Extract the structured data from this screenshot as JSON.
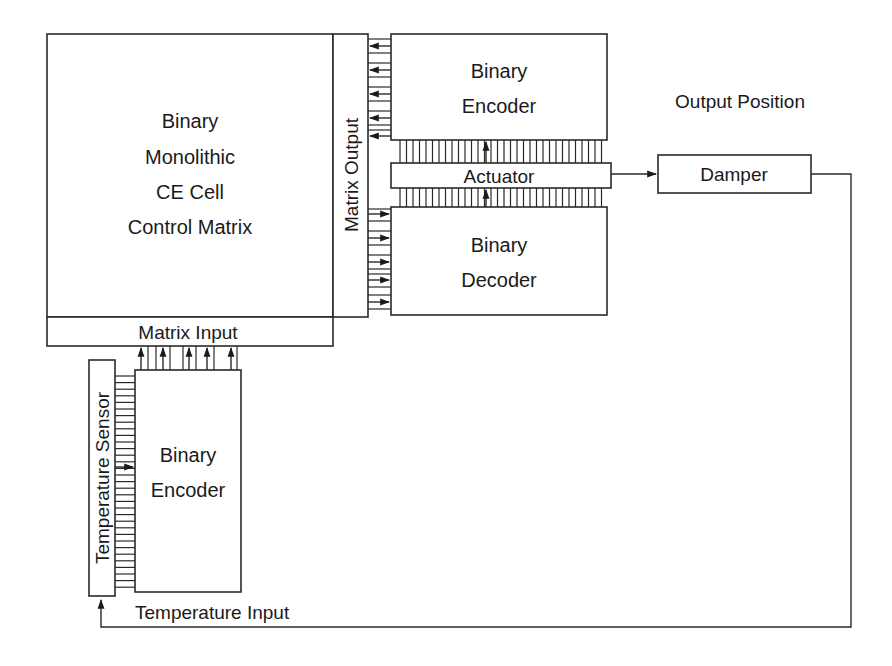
{
  "diagram": {
    "type": "block-diagram",
    "blocks": {
      "control_matrix": {
        "lines": [
          "Binary",
          "Monolithic",
          "CE Cell",
          "Control Matrix"
        ]
      },
      "matrix_input": {
        "label": "Matrix Input"
      },
      "matrix_output": {
        "label": "Matrix Output"
      },
      "output_encoder": {
        "lines": [
          "Binary",
          "Encoder"
        ]
      },
      "actuator": {
        "label": "Actuator"
      },
      "output_decoder": {
        "lines": [
          "Binary",
          "Decoder"
        ]
      },
      "damper": {
        "label": "Damper"
      },
      "temperature_sensor": {
        "label": "Temperature Sensor"
      },
      "input_encoder": {
        "lines": [
          "Binary",
          "Encoder"
        ]
      }
    },
    "labels": {
      "output_position": "Output Position",
      "temperature_input": "Temperature Input"
    },
    "connections": [
      {
        "from": "Binary Encoder (output)",
        "to": "Matrix Output",
        "bits": 5
      },
      {
        "from": "Matrix Output",
        "to": "Binary Decoder",
        "bits": 5
      },
      {
        "from": "Binary Decoder",
        "to": "Actuator",
        "bus": true
      },
      {
        "from": "Actuator",
        "to": "Binary Encoder (output)",
        "bus": true
      },
      {
        "from": "Actuator",
        "to": "Damper"
      },
      {
        "from": "Damper",
        "to": "Temperature Sensor",
        "label": "Temperature Input"
      },
      {
        "from": "Temperature Sensor",
        "to": "Binary Encoder (input)",
        "bus": true
      },
      {
        "from": "Binary Encoder (input)",
        "to": "Matrix Input",
        "bits": 5
      }
    ]
  }
}
